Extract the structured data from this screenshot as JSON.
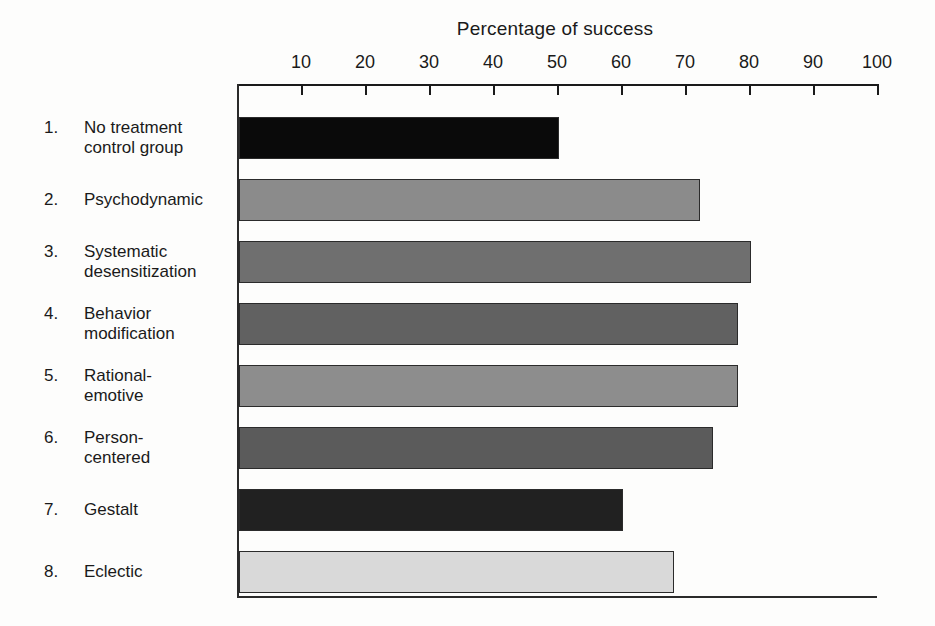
{
  "chart_data": {
    "type": "bar",
    "orientation": "horizontal",
    "title": "Percentage of success",
    "xlabel": "Percentage of success",
    "ylabel": "",
    "xlim": [
      0,
      100
    ],
    "grid": false,
    "legend": null,
    "tick_labels": [
      "10",
      "20",
      "30",
      "40",
      "50",
      "60",
      "70",
      "80",
      "90",
      "100"
    ],
    "ticks": [
      10,
      20,
      30,
      40,
      50,
      60,
      70,
      80,
      90,
      100
    ],
    "categories": [
      "No treatment control group",
      "Psychodynamic",
      "Systematic desensitization",
      "Behavior modification",
      "Rational-emotive",
      "Person-centered",
      "Gestalt",
      "Eclectic"
    ],
    "values": [
      50,
      72,
      80,
      78,
      78,
      74,
      60,
      68
    ],
    "bars": [
      {
        "index": "1.",
        "line1": "No treatment",
        "line2": "control group",
        "value": 50,
        "color": "#0a0a0a"
      },
      {
        "index": "2.",
        "line1": "Psychodynamic",
        "line2": "",
        "value": 72,
        "color": "#8b8b8b"
      },
      {
        "index": "3.",
        "line1": "Systematic",
        "line2": "desensitization",
        "value": 80,
        "color": "#6f6f6f"
      },
      {
        "index": "4.",
        "line1": "Behavior",
        "line2": "modification",
        "value": 78,
        "color": "#616161"
      },
      {
        "index": "5.",
        "line1": "Rational-",
        "line2": "emotive",
        "value": 78,
        "color": "#8d8d8d"
      },
      {
        "index": "6.",
        "line1": "Person-",
        "line2": "centered",
        "value": 74,
        "color": "#5b5b5b"
      },
      {
        "index": "7.",
        "line1": "Gestalt",
        "line2": "",
        "value": 60,
        "color": "#212121"
      },
      {
        "index": "8.",
        "line1": "Eclectic",
        "line2": "",
        "value": 68,
        "color": "#d9d9d9"
      }
    ]
  }
}
